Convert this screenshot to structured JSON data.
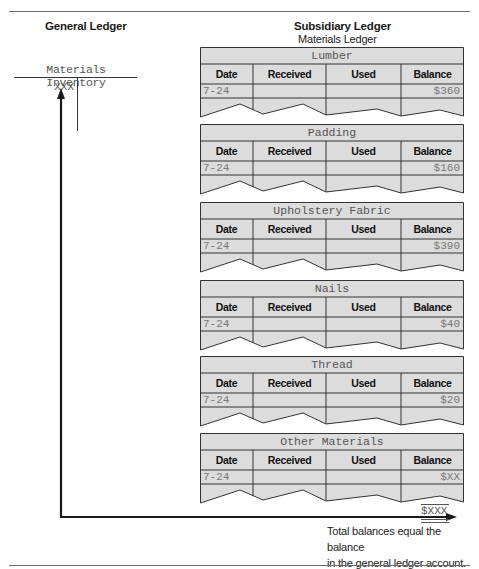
{
  "general_ledger": {
    "heading": "General Ledger",
    "account": {
      "title": "Materials Inventory",
      "debit_balance": "XXX"
    }
  },
  "subsidiary_ledger": {
    "heading": "Subsidiary Ledger",
    "subheading": "Materials Ledger",
    "columns": [
      "Date",
      "Received",
      "Used",
      "Balance"
    ],
    "cards": [
      {
        "title": "Lumber",
        "date": "7-24",
        "received": "",
        "used": "",
        "balance": "$360"
      },
      {
        "title": "Padding",
        "date": "7-24",
        "received": "",
        "used": "",
        "balance": "$160"
      },
      {
        "title": "Upholstery Fabric",
        "date": "7-24",
        "received": "",
        "used": "",
        "balance": "$390"
      },
      {
        "title": "Nails",
        "date": "7-24",
        "received": "",
        "used": "",
        "balance": "$40"
      },
      {
        "title": "Thread",
        "date": "7-24",
        "received": "",
        "used": "",
        "balance": "$20"
      },
      {
        "title": "Other Materials",
        "date": "7-24",
        "received": "",
        "used": "",
        "balance": "$XX"
      }
    ]
  },
  "total": {
    "amount": "$XXX",
    "note_line1": "Total balances equal the balance",
    "note_line2": "in the general ledger account."
  },
  "colors": {
    "card_fill": "#dcdcdc",
    "card_line": "#333333",
    "arrow": "#1a1a1a"
  }
}
